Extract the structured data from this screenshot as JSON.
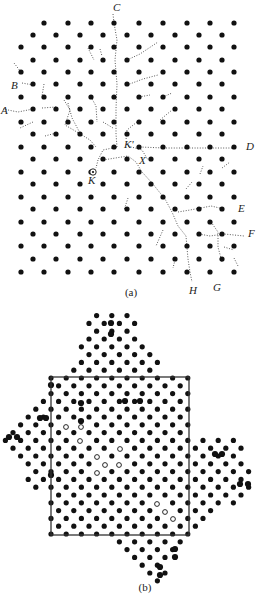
{
  "figure": {
    "panel_a": {
      "caption": "(a)",
      "caption_pos": [
        131,
        296
      ],
      "lattice": {
        "row_y": [
          23,
          35,
          47,
          60,
          72,
          84,
          97,
          109,
          122,
          134,
          147,
          159,
          172,
          184,
          197,
          209,
          222,
          234,
          246,
          259,
          272
        ],
        "even_row_x": [
          21,
          44,
          68,
          91,
          114,
          139,
          163,
          187,
          210,
          234
        ],
        "odd_row_x": [
          33,
          56,
          80,
          103,
          127,
          151,
          175,
          199,
          222
        ],
        "first_row_skip_first": true,
        "dot_radius": 2.6,
        "dot_color": "#111111"
      },
      "labels": [
        {
          "text": "C",
          "x": 113,
          "y": 11
        },
        {
          "text": "B",
          "x": 11,
          "y": 89
        },
        {
          "text": "A",
          "x": 1,
          "y": 114
        },
        {
          "text": "K'",
          "x": 124,
          "y": 148
        },
        {
          "text": "X",
          "x": 139,
          "y": 164
        },
        {
          "text": "K",
          "x": 88,
          "y": 184
        },
        {
          "text": "D",
          "x": 246,
          "y": 150
        },
        {
          "text": "E",
          "x": 238,
          "y": 212
        },
        {
          "text": "F",
          "x": 248,
          "y": 237
        },
        {
          "text": "H",
          "x": 189,
          "y": 294
        },
        {
          "text": "G",
          "x": 213,
          "y": 291
        }
      ],
      "special_site": {
        "name": "K",
        "x": 93,
        "y": 172
      },
      "paths": [
        "M113,14 L114,23 L117,40 L115,60 L117,84 L116,109 L116,134 L117,147",
        "M22,83 L33,85",
        "M3,109 L18,112 L33,109",
        "M42,108 L56,107",
        "M117,147 L103,150 L98,160",
        "M103,160 L128,156 L136,162 L142,172 L152,183 L165,199 L172,212 L178,226 L186,236 L188,259 L190,272 L192,282",
        "M128,146 L142,150 L148,160",
        "M140,147 L164,148 L187,148 L211,148 L236,148",
        "M178,212 L190,210 L201,208 L211,206 L224,209",
        "M199,234 L210,236 L224,234 L244,236",
        "M211,222 L218,232 L218,247 L222,262",
        "M98,160 L96,168",
        "M127,60 L140,54 L158,42",
        "M127,85 L143,79 L158,75",
        "M139,97 L150,95",
        "M163,97 L172,93",
        "M64,100 L70,110 L65,125 L82,135 L90,140 L96,147",
        "M68,103 L72,118 L80,133",
        "M91,97 L96,106 L97,122",
        "M44,84 L42,96",
        "M88,48 L94,60",
        "M100,49 L102,56",
        "M14,63 L21,72",
        "M103,122 L113,128",
        "M56,133 L45,136",
        "M33,122 L20,128",
        "M137,122 L127,130 L126,140",
        "M160,120 L172,110",
        "M186,189 L192,182",
        "M200,174 L203,166",
        "M222,168 L230,162",
        "M128,198 L124,210",
        "M163,230 L156,246",
        "M175,260 L173,268",
        "M234,258 L238,266",
        "M224,247 L234,250"
      ],
      "path_color": "#444444"
    },
    "panel_b": {
      "caption": "(b)",
      "caption_pos": [
        145,
        591
      ],
      "lattice": {
        "origin_x": 51,
        "origin_y": 378,
        "dx": 15.2,
        "dy": 7.8,
        "row_range": [
          -9,
          30
        ],
        "col_range": [
          -4,
          16
        ],
        "dot_radius": 2.6,
        "dot_color": "#111111"
      },
      "square": {
        "x1": 51,
        "y1": 377,
        "x2": 189,
        "y2": 535,
        "stroke": "#333333"
      },
      "outline_polygon": [
        [
          88,
          312
        ],
        [
          130,
          312
        ],
        [
          158,
          358
        ],
        [
          158,
          377
        ],
        [
          189,
          377
        ],
        [
          189,
          440
        ],
        [
          236,
          440
        ],
        [
          254,
          468
        ],
        [
          246,
          502
        ],
        [
          200,
          520
        ],
        [
          189,
          535
        ],
        [
          178,
          552
        ],
        [
          165,
          582
        ],
        [
          148,
          582
        ],
        [
          112,
          543
        ],
        [
          112,
          535
        ],
        [
          51,
          535
        ],
        [
          51,
          490
        ],
        [
          36,
          493
        ],
        [
          12,
          455
        ],
        [
          2,
          440
        ],
        [
          22,
          410
        ],
        [
          45,
          390
        ],
        [
          51,
          385
        ],
        [
          51,
          377
        ],
        [
          72,
          377
        ],
        [
          74,
          355
        ],
        [
          88,
          312
        ]
      ],
      "hollow_sites": [
        [
          66,
          427
        ],
        [
          81,
          427
        ],
        [
          80,
          441
        ],
        [
          120,
          449
        ],
        [
          97,
          457
        ],
        [
          105,
          465
        ],
        [
          119,
          465
        ],
        [
          97,
          473
        ],
        [
          157,
          504
        ],
        [
          165,
          512
        ],
        [
          173,
          519
        ]
      ],
      "hollow_color": "#ffffff",
      "emphasized_sites": [
        [
          111,
          323
        ],
        [
          111,
          334
        ],
        [
          81,
          421
        ],
        [
          81,
          403
        ],
        [
          125,
          401
        ],
        [
          140,
          401
        ],
        [
          40,
          418
        ],
        [
          46,
          418
        ],
        [
          9,
          437
        ],
        [
          17,
          437
        ],
        [
          215,
          454
        ],
        [
          222,
          454
        ],
        [
          240,
          484
        ],
        [
          248,
          484
        ],
        [
          175,
          549
        ],
        [
          175,
          557
        ],
        [
          160,
          567
        ],
        [
          160,
          575
        ],
        [
          51,
          385
        ],
        [
          51,
          475
        ]
      ]
    }
  }
}
